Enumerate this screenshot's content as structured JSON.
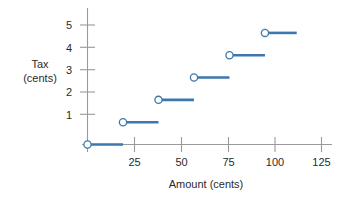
{
  "chart_data": {
    "type": "line",
    "title": "",
    "xlabel": "Amount (cents)",
    "ylabel_line1": "Tax",
    "ylabel_line2": "(cents)",
    "xlim": [
      0,
      130
    ],
    "ylim": [
      0,
      5.6
    ],
    "grid": false,
    "legend": false,
    "xticks": [
      25,
      50,
      75,
      100,
      125
    ],
    "xtick_labels": [
      "25",
      "50",
      "75",
      "100",
      "125"
    ],
    "yticks": [
      1,
      2,
      3,
      4,
      5
    ],
    "ytick_labels": [
      "1",
      "2",
      "3",
      "4",
      "5"
    ],
    "series_name": "Sales tax step function",
    "marker": "open-circle",
    "steps": [
      {
        "tax": 0,
        "x_start": 0,
        "x_end": 19,
        "closed_left": true,
        "open_right": true
      },
      {
        "tax": 1,
        "x_start": 19,
        "x_end": 38,
        "closed_left": true,
        "open_right": true
      },
      {
        "tax": 2,
        "x_start": 38,
        "x_end": 57,
        "closed_left": true,
        "open_right": true
      },
      {
        "tax": 3,
        "x_start": 57,
        "x_end": 76,
        "closed_left": true,
        "open_right": true
      },
      {
        "tax": 4,
        "x_start": 76,
        "x_end": 95,
        "closed_left": true,
        "open_right": true
      },
      {
        "tax": 5,
        "x_start": 95,
        "x_end": 112,
        "closed_left": true,
        "open_right": true
      }
    ],
    "colors": {
      "series": "#3d77ad",
      "axis": "#9a9a9a",
      "text": "#2b2b2b",
      "marker_fill": "#ffffff"
    }
  }
}
